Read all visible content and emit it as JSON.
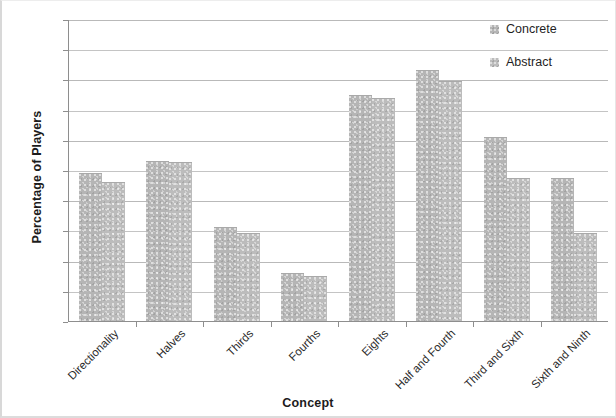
{
  "chart_data": {
    "type": "bar",
    "title": "",
    "xlabel": "Concept",
    "ylabel": "Percentage of Players",
    "ylim": [
      0,
      100
    ],
    "ytick_step": 10,
    "yticks": [
      100,
      90,
      80,
      70,
      60,
      50,
      40,
      30,
      20,
      10,
      0
    ],
    "grid": "horizontal",
    "legend_position": "top-right",
    "categories": [
      "Directionality",
      "Halves",
      "Thirds",
      "Fourths",
      "Eights",
      "Half and Fourth",
      "Third and Sixth",
      "Sixth and Ninth"
    ],
    "series": [
      {
        "name": "Concrete",
        "color": "#b5b5b5",
        "values": [
          49,
          53,
          31,
          16,
          75,
          83,
          61,
          47.5
        ]
      },
      {
        "name": "Abstract",
        "color": "#bcbcbc",
        "values": [
          46,
          52.5,
          29,
          15,
          74,
          79.5,
          47.5,
          29
        ]
      }
    ]
  }
}
